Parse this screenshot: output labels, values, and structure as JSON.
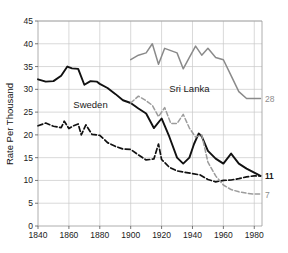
{
  "chart_data": {
    "type": "line",
    "title": "",
    "xlabel": "",
    "ylabel": "Rate Per Thousand",
    "xlim": [
      1840,
      1985
    ],
    "ylim": [
      0,
      45
    ],
    "grid": true,
    "legend_position": "inline-annotations",
    "xticks": [
      1840,
      1860,
      1880,
      1900,
      1920,
      1940,
      1960,
      1980
    ],
    "yticks": [
      0,
      5,
      10,
      15,
      20,
      25,
      30,
      35,
      40,
      45
    ],
    "annotations": [
      {
        "text": "Sweden",
        "x": 1874,
        "y": 26.5
      },
      {
        "text": "Sri Lanka",
        "x": 1938,
        "y": 30.0
      }
    ],
    "end_labels": [
      {
        "text": "28",
        "series": "Sri Lanka birth rate",
        "value": 28,
        "color": "#8d8d8d"
      },
      {
        "text": "11",
        "series": "Sweden birth rate",
        "value": 11,
        "color": "#1a1a1a"
      },
      {
        "text": "11",
        "series": "Sweden death rate",
        "value": 11,
        "color": "#1a1a1a"
      },
      {
        "text": "7",
        "series": "Sri Lanka death rate",
        "value": 7,
        "color": "#8d8d8d"
      }
    ],
    "series": [
      {
        "name": "Sweden birth rate",
        "style": "solid-black",
        "color": "#111111",
        "x": [
          1840,
          1845,
          1850,
          1855,
          1859,
          1862,
          1866,
          1870,
          1874,
          1878,
          1880,
          1885,
          1890,
          1895,
          1900,
          1905,
          1910,
          1915,
          1920,
          1925,
          1930,
          1934,
          1938,
          1941,
          1944,
          1946,
          1950,
          1955,
          1960,
          1965,
          1970,
          1975,
          1980,
          1984
        ],
        "values": [
          32.2,
          31.7,
          31.8,
          33.0,
          35.0,
          34.6,
          34.5,
          31.0,
          31.8,
          31.7,
          31.2,
          30.3,
          29.0,
          27.6,
          27.0,
          25.8,
          24.7,
          21.5,
          23.6,
          19.6,
          15.0,
          13.7,
          15.0,
          18.0,
          20.3,
          19.7,
          16.5,
          14.8,
          13.7,
          15.9,
          13.7,
          12.6,
          11.7,
          11.0
        ]
      },
      {
        "name": "Sweden death rate",
        "style": "dashed-black",
        "color": "#111111",
        "x": [
          1840,
          1845,
          1850,
          1855,
          1857,
          1860,
          1863,
          1866,
          1868,
          1871,
          1875,
          1880,
          1885,
          1890,
          1895,
          1900,
          1905,
          1910,
          1915,
          1918,
          1920,
          1925,
          1930,
          1935,
          1940,
          1945,
          1950,
          1955,
          1960,
          1965,
          1970,
          1975,
          1980,
          1984
        ],
        "values": [
          22.0,
          22.6,
          21.9,
          21.6,
          23.0,
          21.4,
          22.0,
          22.4,
          20.0,
          22.2,
          20.1,
          19.9,
          18.3,
          17.5,
          16.9,
          16.8,
          15.6,
          14.5,
          14.7,
          18.0,
          14.6,
          12.9,
          12.1,
          11.8,
          11.5,
          11.2,
          10.2,
          9.7,
          10.0,
          10.1,
          10.4,
          10.8,
          11.0,
          11.0
        ]
      },
      {
        "name": "Sri Lanka birth rate",
        "style": "solid-gray",
        "color": "#8a8a8a",
        "x": [
          1900,
          1905,
          1910,
          1914,
          1918,
          1922,
          1926,
          1930,
          1934,
          1938,
          1942,
          1946,
          1950,
          1955,
          1960,
          1965,
          1970,
          1975,
          1980,
          1984
        ],
        "values": [
          36.5,
          37.5,
          38.0,
          40.0,
          35.5,
          39.0,
          38.5,
          38.0,
          34.5,
          37.0,
          39.5,
          37.5,
          39.0,
          37.0,
          36.5,
          33.0,
          29.5,
          28.0,
          28.0,
          28.0
        ]
      },
      {
        "name": "Sri Lanka death rate",
        "style": "dashed-gray",
        "color": "#9c9c9c",
        "x": [
          1900,
          1905,
          1910,
          1914,
          1918,
          1922,
          1926,
          1930,
          1934,
          1938,
          1942,
          1946,
          1950,
          1955,
          1960,
          1965,
          1970,
          1975,
          1980,
          1984
        ],
        "values": [
          27.0,
          28.5,
          27.5,
          26.5,
          24.0,
          26.0,
          22.5,
          22.5,
          24.5,
          21.5,
          19.5,
          20.0,
          14.0,
          11.0,
          9.0,
          8.0,
          7.5,
          7.2,
          7.0,
          7.0
        ]
      }
    ]
  }
}
